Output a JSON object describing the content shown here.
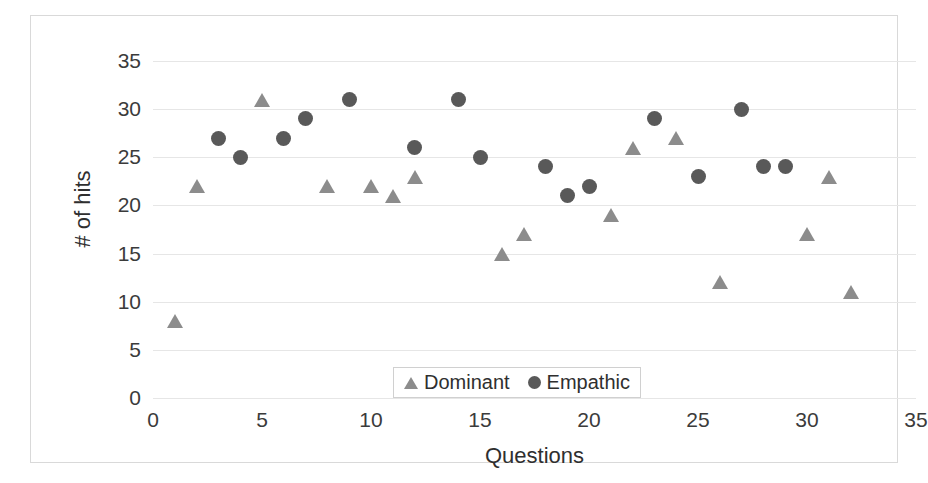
{
  "chart_data": {
    "type": "scatter",
    "title": "",
    "xlabel": "Questions",
    "ylabel": "# of hits",
    "xlim": [
      0,
      35
    ],
    "ylim": [
      0,
      35
    ],
    "xticks": [
      0,
      5,
      10,
      15,
      20,
      25,
      30,
      35
    ],
    "yticks": [
      0,
      5,
      10,
      15,
      20,
      25,
      30,
      35
    ],
    "grid": "horizontal",
    "legend_position": "inside-bottom-center",
    "colors": {
      "dominant": "#8c8c8c",
      "empathic": "#595959",
      "gridline": "#e6e6e6",
      "frame": "#d9d9d9",
      "text": "#3b3b3b"
    },
    "series": [
      {
        "name": "Dominant",
        "marker": "triangle",
        "color": "#8c8c8c",
        "points": [
          {
            "x": 1,
            "y": 8
          },
          {
            "x": 2,
            "y": 22
          },
          {
            "x": 5,
            "y": 31
          },
          {
            "x": 8,
            "y": 22
          },
          {
            "x": 10,
            "y": 22
          },
          {
            "x": 11,
            "y": 21
          },
          {
            "x": 12,
            "y": 23
          },
          {
            "x": 16,
            "y": 15
          },
          {
            "x": 17,
            "y": 17
          },
          {
            "x": 21,
            "y": 19
          },
          {
            "x": 22,
            "y": 26
          },
          {
            "x": 24,
            "y": 27
          },
          {
            "x": 26,
            "y": 12
          },
          {
            "x": 30,
            "y": 17
          },
          {
            "x": 31,
            "y": 23
          },
          {
            "x": 32,
            "y": 11
          }
        ]
      },
      {
        "name": "Empathic",
        "marker": "circle",
        "color": "#595959",
        "points": [
          {
            "x": 3,
            "y": 27
          },
          {
            "x": 4,
            "y": 25
          },
          {
            "x": 6,
            "y": 27
          },
          {
            "x": 7,
            "y": 29
          },
          {
            "x": 9,
            "y": 31
          },
          {
            "x": 12,
            "y": 26
          },
          {
            "x": 14,
            "y": 31
          },
          {
            "x": 15,
            "y": 25
          },
          {
            "x": 18,
            "y": 24
          },
          {
            "x": 19,
            "y": 21
          },
          {
            "x": 20,
            "y": 22
          },
          {
            "x": 23,
            "y": 29
          },
          {
            "x": 25,
            "y": 23
          },
          {
            "x": 27,
            "y": 30
          },
          {
            "x": 28,
            "y": 24
          },
          {
            "x": 29,
            "y": 24
          }
        ]
      }
    ]
  },
  "legend": {
    "entries": [
      {
        "label": "Dominant",
        "marker": "triangle"
      },
      {
        "label": "Empathic",
        "marker": "circle"
      }
    ]
  }
}
